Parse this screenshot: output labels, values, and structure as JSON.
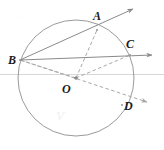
{
  "figure": {
    "type": "geometry-diagram",
    "width": 164,
    "height": 150,
    "background_color": "#ffffff",
    "stroke_color": "#8a8a8a",
    "dash_color": "#a6a6a6",
    "label_color": "#1a1a1a",
    "baseline_color": "#d8d8d8",
    "watermark_color": "#efefef"
  },
  "circle": {
    "name": "main-circle",
    "center_label": "O",
    "cx": 76,
    "cy": 78,
    "r": 58,
    "stroke": "#9a9a9a",
    "stroke_width": 1
  },
  "points": [
    {
      "id": "A",
      "label": "A",
      "x": 97,
      "y": 30,
      "label_x": 93,
      "label_y": 10
    },
    {
      "id": "B",
      "label": "B",
      "x": 20,
      "y": 60,
      "label_x": 8,
      "label_y": 54
    },
    {
      "id": "C",
      "label": "C",
      "x": 130,
      "y": 55,
      "label_x": 126,
      "label_y": 38
    },
    {
      "id": "D",
      "label": "D",
      "x": 122,
      "y": 105,
      "label_x": 124,
      "label_y": 100
    },
    {
      "id": "O",
      "label": "O",
      "x": 76,
      "y": 78,
      "label_x": 62,
      "label_y": 83
    }
  ],
  "solid_rays": [
    {
      "name": "ray-B-to-A",
      "from": "B",
      "through": "A",
      "x1": 20,
      "y1": 60,
      "x2": 133,
      "y2": 9,
      "arrow": true
    },
    {
      "name": "ray-B-to-C",
      "from": "B",
      "through": "C",
      "x1": 20,
      "y1": 60,
      "x2": 152,
      "y2": 55,
      "arrow": true
    }
  ],
  "dashed_segments": [
    {
      "name": "radius-O-to-A",
      "x1": 76,
      "y1": 78,
      "x2": 97,
      "y2": 30
    },
    {
      "name": "radius-O-to-B",
      "x1": 76,
      "y1": 78,
      "x2": 20,
      "y2": 60
    },
    {
      "name": "radius-O-to-C",
      "x1": 76,
      "y1": 78,
      "x2": 130,
      "y2": 55
    }
  ],
  "dashed_rays": [
    {
      "name": "ray-B-through-O-to-D",
      "x1": 20,
      "y1": 60,
      "x2": 147,
      "y2": 102,
      "arrow": true
    }
  ],
  "baseline": {
    "name": "horizontal-baseline",
    "x1": 0,
    "y1": 74,
    "x2": 164,
    "y2": 74
  },
  "watermark": {
    "text": "V",
    "x": 56,
    "y": 108
  },
  "top_artifact": {
    "text": "· · · ·",
    "x": 4,
    "y": 14
  }
}
